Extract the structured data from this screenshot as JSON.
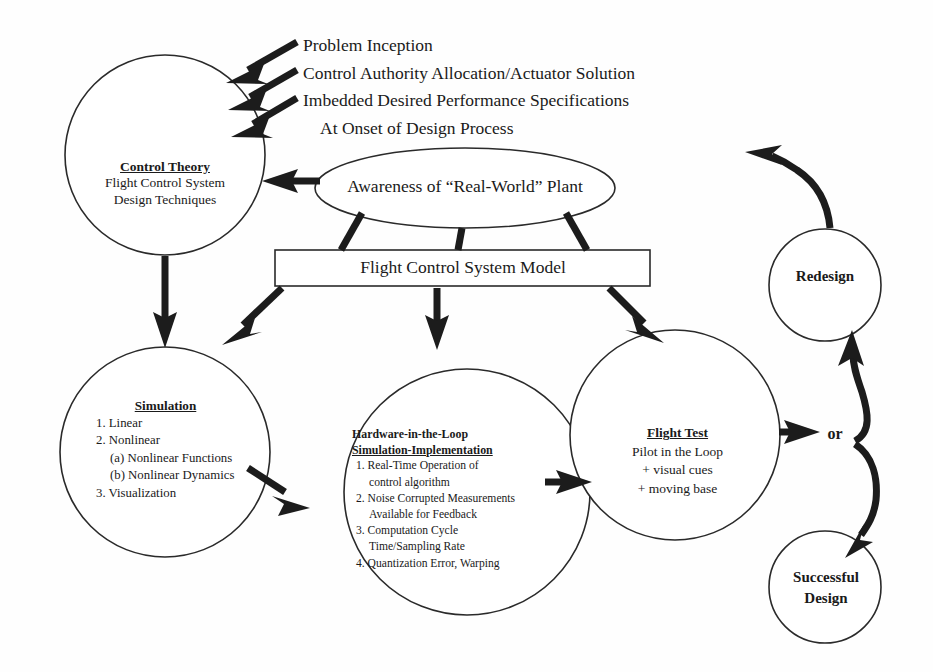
{
  "diagram": {
    "colors": {
      "stroke": "#1c1c1c",
      "outline": "#2a2a2a",
      "background": "#ffffff",
      "text": "#1a1a1a"
    },
    "source_inputs": [
      "Problem Inception",
      "Control Authority Allocation/Actuator Solution",
      "Imbedded Desired Performance Specifications",
      "At Onset of Design Process"
    ],
    "nodes": {
      "control_theory": {
        "shape": "circle",
        "heading": "Control Theory",
        "lines": [
          "Flight Control System",
          "Design Techniques"
        ]
      },
      "awareness": {
        "shape": "ellipse",
        "label": "Awareness of “Real-World” Plant"
      },
      "model": {
        "shape": "rectangle",
        "label": "Flight Control System Model"
      },
      "simulation": {
        "shape": "circle",
        "heading": "Simulation",
        "items": [
          "1. Linear",
          "2. Nonlinear",
          "(a) Nonlinear Functions",
          "(b) Nonlinear Dynamics",
          "3. Visualization"
        ]
      },
      "hardware_in_the_loop": {
        "shape": "circle",
        "heading_line1": "Hardware-in-the-Loop",
        "heading_line2": "Simulation-Implementation",
        "items": [
          "1. Real-Time Operation of",
          "control algorithm",
          "2. Noise Corrupted Measurements",
          "Available for Feedback",
          "3. Computation Cycle",
          "Time/Sampling Rate",
          "4. Quantization Error, Warping"
        ]
      },
      "flight_test": {
        "shape": "circle",
        "heading": "Flight Test",
        "lines": [
          "Pilot in the Loop",
          "+ visual cues",
          "+ moving base"
        ]
      },
      "redesign": {
        "shape": "circle",
        "label": "Redesign"
      },
      "successful_design": {
        "shape": "circle",
        "line1": "Successful",
        "line2": "Design"
      },
      "branch": {
        "label": "or"
      }
    }
  }
}
